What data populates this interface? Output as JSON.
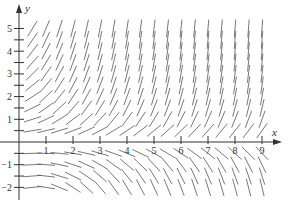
{
  "diagram": {
    "type": "slope-field",
    "axes": {
      "x_name": "x",
      "y_name": "y",
      "x_ticks": [
        "1",
        "2",
        "3",
        "4",
        "5",
        "6",
        "7",
        "8",
        "9"
      ],
      "y_ticks": [
        {
          "value": 5,
          "label": "5"
        },
        {
          "value": 4,
          "label": "4"
        },
        {
          "value": 3,
          "label": "3"
        },
        {
          "value": 2,
          "label": "2"
        },
        {
          "value": 1,
          "label": "1"
        },
        {
          "value": -1,
          "label": "−1"
        },
        {
          "value": -2,
          "label": "−2"
        }
      ],
      "x_range": [
        0,
        9.5
      ],
      "y_range": [
        -2.5,
        5.5
      ]
    },
    "field": {
      "x_start": 0.5,
      "x_end": 9,
      "x_step": 0.5,
      "y_values": [
        5,
        4.5,
        4,
        3.5,
        3,
        2.5,
        2,
        1.5,
        1,
        0.5,
        -0.5,
        -1,
        -1.5,
        -2
      ],
      "segment_length_px": 18
    },
    "colors": {
      "axis": "#333333",
      "segment": "#555555",
      "background": "#ffffff"
    }
  }
}
